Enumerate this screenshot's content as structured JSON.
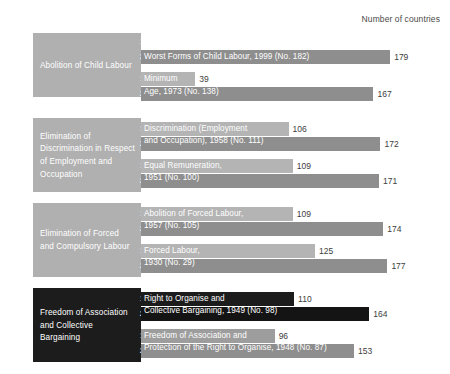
{
  "header": {
    "axis_caption": "Number of countries"
  },
  "chart_data": {
    "type": "bar",
    "title": "",
    "xlabel": "Number of countries",
    "ylabel": "",
    "xlim": [
      0,
      200
    ],
    "grid": false,
    "legend": "none",
    "orientation": "horizontal",
    "series": [
      {
        "name": "1990"
      },
      {
        "name": "2014"
      }
    ],
    "groups": [
      {
        "category": "Abolition of Child Labour",
        "theme": "light",
        "conventions": [
          {
            "label": "Worst Forms of Child Labour, 1999 (No. 182)",
            "label_lines": [
              "Worst Forms of Child Labour, 1999 (No. 182)"
            ],
            "values": [
              {
                "year": "1990",
                "value": 0,
                "value_label": ""
              },
              {
                "year": "2014",
                "value": 179,
                "value_label": "179"
              }
            ]
          },
          {
            "label": "Minimum Age, 1973 (No. 138)",
            "label_lines": [
              "Minimum",
              "Age, 1973 (No. 138)"
            ],
            "values": [
              {
                "year": "1990",
                "value": 39,
                "value_label": "39"
              },
              {
                "year": "2014",
                "value": 167,
                "value_label": "167"
              }
            ]
          }
        ]
      },
      {
        "category": "Elimination of Discrimination in Respect of Employment and Occupation",
        "theme": "light",
        "conventions": [
          {
            "label": "Discrimination (Employment and Occupation), 1958 (No. 111)",
            "label_lines": [
              "Discrimination (Employment",
              "and Occupation), 1958 (No. 111)"
            ],
            "values": [
              {
                "year": "1990",
                "value": 106,
                "value_label": "106"
              },
              {
                "year": "2014",
                "value": 172,
                "value_label": "172"
              }
            ]
          },
          {
            "label": "Equal Remuneration, 1951 (No. 100)",
            "label_lines": [
              "Equal Remuneration,",
              "1951 (No. 100)"
            ],
            "values": [
              {
                "year": "1990",
                "value": 109,
                "value_label": "109"
              },
              {
                "year": "2014",
                "value": 171,
                "value_label": "171"
              }
            ]
          }
        ]
      },
      {
        "category": "Elimination of Forced and Compulsory Labour",
        "theme": "light",
        "conventions": [
          {
            "label": "Abolition of Forced Labour, 1957 (No. 105)",
            "label_lines": [
              "Abolition of Forced Labour,",
              "1957 (No. 105)"
            ],
            "values": [
              {
                "year": "1990",
                "value": 109,
                "value_label": "109"
              },
              {
                "year": "2014",
                "value": 174,
                "value_label": "174"
              }
            ]
          },
          {
            "label": "Forced Labour, 1930 (No. 29)",
            "label_lines": [
              "Forced Labour,",
              "1930 (No. 29)"
            ],
            "values": [
              {
                "year": "1990",
                "value": 125,
                "value_label": "125"
              },
              {
                "year": "2014",
                "value": 177,
                "value_label": "177"
              }
            ]
          }
        ]
      },
      {
        "category": "Freedom of Association and Collective Bargaining",
        "theme": "dark",
        "conventions": [
          {
            "label": "Right to Organise and Collective Bargaining, 1949 (No. 98)",
            "label_lines": [
              "Right to Organise and",
              "Collective Bargaining, 1949 (No. 98)"
            ],
            "values": [
              {
                "year": "1990",
                "value": 110,
                "value_label": "110"
              },
              {
                "year": "2014",
                "value": 164,
                "value_label": "164"
              }
            ]
          },
          {
            "label": "Freedom of Association and Protection of the Right to Organise, 1948 (No. 87)",
            "label_lines": [
              "Freedom of Association and",
              "Protection of the Right to Organise, 1948 (No. 87)"
            ],
            "values": [
              {
                "year": "1990",
                "value": 96,
                "value_label": "96"
              },
              {
                "year": "2014",
                "value": 153,
                "value_label": "153"
              }
            ]
          }
        ]
      }
    ]
  },
  "colors": {
    "bar_1990_light": "#b4b4b4",
    "bar_2014_light": "#8e8e8e",
    "block_light": "#b0b0b0",
    "block_dark": "#1c1c1c",
    "background": "#ffffff",
    "text": "#333333"
  }
}
